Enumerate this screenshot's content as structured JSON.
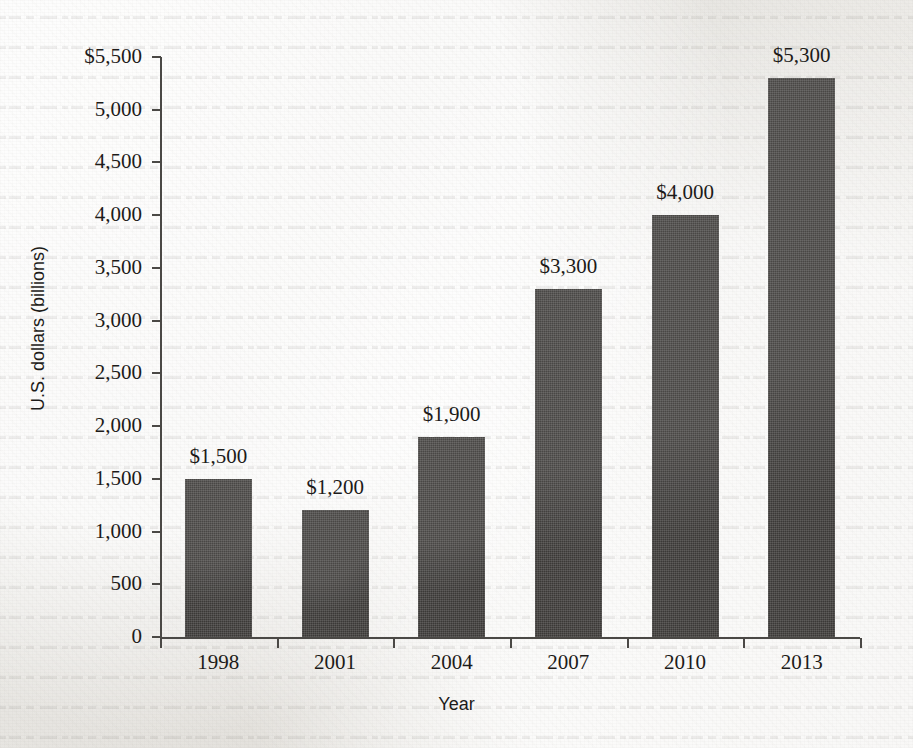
{
  "chart_data": {
    "type": "bar",
    "title": "",
    "xlabel": "Year",
    "ylabel": "U.S. dollars (billions)",
    "categories": [
      "1998",
      "2001",
      "2004",
      "2007",
      "2010",
      "2013"
    ],
    "values": [
      1500,
      1200,
      1900,
      3300,
      4000,
      5300
    ],
    "data_labels": [
      "$1,500",
      "$1,200",
      "$1,900",
      "$3,300",
      "$4,000",
      "$5,300"
    ],
    "ylim": [
      0,
      5500
    ],
    "ytick_values": [
      0,
      500,
      1000,
      1500,
      2000,
      2500,
      3000,
      3500,
      4000,
      4500,
      5000,
      5500
    ],
    "ytick_labels": [
      "0",
      "500",
      "1,000",
      "1,500",
      "2,000",
      "2,500",
      "3,000",
      "3,500",
      "4,000",
      "4,500",
      "5,000",
      "$5,500"
    ],
    "grid": false,
    "legend": null,
    "bar_color": "#3b3937",
    "axis_color": "#4a4845",
    "text_color": "#1d1b19",
    "background_color": "#f1f0ed"
  }
}
